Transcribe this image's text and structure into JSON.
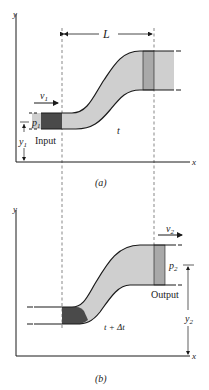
{
  "figure_a": {
    "caption": "(a)",
    "axis_y_label": "y",
    "axis_x_label": "x",
    "length_label": "L",
    "velocity_label": "v",
    "velocity_sub": "1",
    "pressure_label": "p",
    "pressure_sub": "1",
    "height_label": "y",
    "height_sub": "1",
    "region_label": "Input",
    "time_label": "t"
  },
  "figure_b": {
    "caption": "(b)",
    "axis_y_label": "y",
    "axis_x_label": "x",
    "velocity_label": "v",
    "velocity_sub": "2",
    "pressure_label": "p",
    "pressure_sub": "2",
    "height_label": "y",
    "height_sub": "2",
    "region_label": "Output",
    "time_label": "t + Δt"
  },
  "colors": {
    "fluid": "#cfcfcf",
    "input_slab": "#4a4a4a",
    "output_slab": "#a9a9a9",
    "line": "#1a1a1a"
  }
}
